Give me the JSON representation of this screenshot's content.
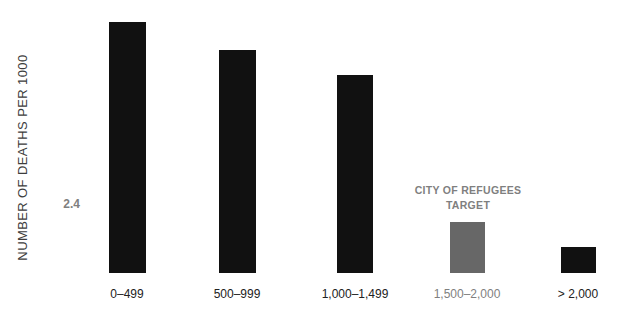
{
  "chart_data": {
    "type": "bar",
    "title": "",
    "ylabel": "NUMBER OF DEATHS PER 1000",
    "xlabel": "",
    "categories": [
      "0–499",
      "500–999",
      "1,000–1,499",
      "1,500–2,000",
      "> 2,000"
    ],
    "values": [
      11.8,
      10.5,
      9.3,
      2.4,
      1.2
    ],
    "ylim": [
      0,
      12
    ],
    "grid": false,
    "legend": "none",
    "bar_colors": [
      "#111111",
      "#111111",
      "#111111",
      "#676767",
      "#111111"
    ],
    "label_colors": [
      "#222222",
      "#222222",
      "#222222",
      "#7f7f7f",
      "#222222"
    ],
    "target": {
      "category_index": 3,
      "value": 2.4,
      "value_label": "2.4",
      "annotation": "CITY OF REFUGEES TARGET"
    },
    "colors": {
      "background": "#ffffff",
      "bar_black": "#111111",
      "bar_target_gray": "#676767",
      "gray_text": "#7f7f7f",
      "axis_text": "#3d3d3d"
    }
  }
}
